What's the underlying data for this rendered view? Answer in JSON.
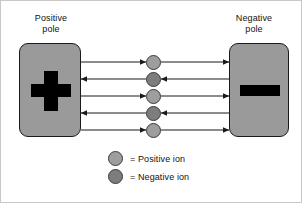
{
  "figure": {
    "background_color": "#ffffff",
    "border_color": "#c8c8c8"
  },
  "poles": {
    "positive": {
      "label": "Positive\npole",
      "symbol": "plus",
      "symbol_color": "#000000",
      "fill_color": "#9a9a9a",
      "border_color": "#1a1a1a"
    },
    "negative": {
      "label": "Negative\npole",
      "symbol": "minus",
      "symbol_color": "#000000",
      "fill_color": "#9a9a9a",
      "border_color": "#1a1a1a"
    }
  },
  "colors": {
    "positive_ion": "#9e9e9e",
    "negative_ion": "#7d7d7d",
    "ion_outline": "#3a3a3a",
    "arrow": "#1a1a1a"
  },
  "ion_chain": {
    "count": 5,
    "ions": [
      {
        "type": "positive",
        "color": "#9e9e9e",
        "cy": 61
      },
      {
        "type": "negative",
        "color": "#7d7d7d",
        "cy": 78
      },
      {
        "type": "positive",
        "color": "#9e9e9e",
        "cy": 95
      },
      {
        "type": "negative",
        "color": "#7d7d7d",
        "cy": 112
      },
      {
        "type": "positive",
        "color": "#9e9e9e",
        "cy": 129
      }
    ]
  },
  "arrow_rows": [
    {
      "index": 1,
      "y": 61,
      "direction": "right",
      "left_head": "ion",
      "right_head": "negative-pole"
    },
    {
      "index": 2,
      "y": 78,
      "direction": "left",
      "left_head": "positive-pole",
      "right_head": "ion"
    },
    {
      "index": 3,
      "y": 95,
      "direction": "right",
      "left_head": "ion",
      "right_head": "negative-pole"
    },
    {
      "index": 4,
      "y": 112,
      "direction": "left",
      "left_head": "positive-pole",
      "right_head": "ion"
    },
    {
      "index": 5,
      "y": 129,
      "direction": "right",
      "left_head": "ion",
      "right_head": "negative-pole"
    }
  ],
  "legend": {
    "items": [
      {
        "swatch": "positive",
        "equals": "=",
        "label": "= Positive ion",
        "color": "#9e9e9e"
      },
      {
        "swatch": "negative",
        "equals": "=",
        "label": "= Negative ion",
        "color": "#7d7d7d"
      }
    ]
  }
}
